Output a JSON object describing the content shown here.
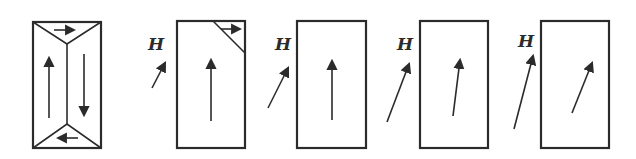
{
  "figure": {
    "field_label": "H",
    "colors": {
      "stroke": "#2b2b2b",
      "background": "#ffffff"
    },
    "panels": [
      {
        "id": 1,
        "field_label_visible": false,
        "domains": "closure domains: two vertical antiparallel domains with top/bottom triangular closure domains"
      },
      {
        "id": 2,
        "field_label_visible": true,
        "domains": "single vertical domain with small corner closure domain"
      },
      {
        "id": 3,
        "field_label_visible": true,
        "domains": "single domain, magnetization vertical"
      },
      {
        "id": 4,
        "field_label_visible": true,
        "domains": "single domain, magnetization slightly rotated toward H"
      },
      {
        "id": 5,
        "field_label_visible": true,
        "domains": "single domain, magnetization rotated further toward H"
      }
    ]
  }
}
